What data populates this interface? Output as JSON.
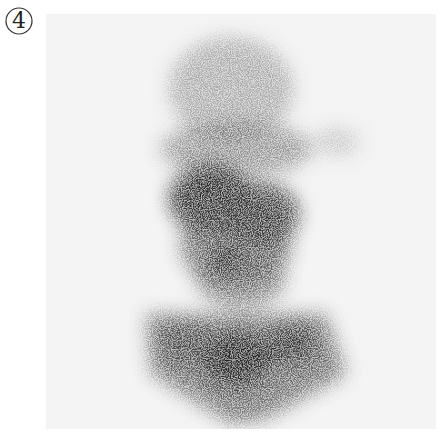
{
  "figure": {
    "panel_label": "4",
    "image_type": "grayscale scintigraphy image",
    "background_color": "#f4f4f4",
    "uptake_color": "#1a1a1a"
  }
}
